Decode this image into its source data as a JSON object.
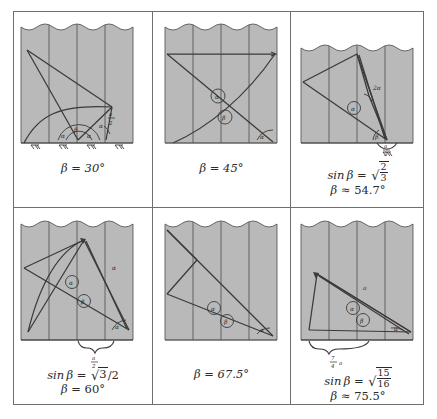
{
  "figure": {
    "kind": "geometry-diagram-grid",
    "rows": 2,
    "cols": 3,
    "background": "#ffffff",
    "border_color": "#6f6f6f",
    "shade_color": "#b9b9b9",
    "ink_color": "#3a3a3a",
    "label_alpha": "α",
    "label_beta": "β",
    "label_two_alpha": "2α"
  },
  "panels": [
    {
      "id": "panel-1",
      "caption_lines": [
        "β = 30°"
      ],
      "caption_html": "single",
      "beta_deg": 30,
      "angle_labels": [
        "α",
        "β"
      ],
      "measure_label": {
        "num": "a",
        "den": "2"
      },
      "has_curve": true,
      "has_ground_hatch": true,
      "hatch_count": 4,
      "has_brace": false,
      "stripe_count": 4
    },
    {
      "id": "panel-2",
      "caption_lines": [
        "β = 45°"
      ],
      "caption_html": "single",
      "beta_deg": 45,
      "angle_labels": [
        "α",
        "β"
      ],
      "measure_label": null,
      "has_curve": true,
      "has_ground_hatch": false,
      "hatch_count": 0,
      "has_brace": false,
      "stripe_count": 4
    },
    {
      "id": "panel-3",
      "caption_lines": [
        "sin β = √(2/3)",
        "β ≈ 54.7°"
      ],
      "caption_html": "sqrt-frac",
      "sqrt_numerator": "2",
      "sqrt_denominator": "3",
      "beta_deg": 54.7,
      "beta_relation": "≈",
      "angle_labels": [
        "α",
        "β",
        "2α"
      ],
      "measure_label": {
        "num": "a",
        "den": "3"
      },
      "has_curve": false,
      "has_ground_hatch": true,
      "hatch_count": 1,
      "has_brace": false,
      "stripe_count": 4
    },
    {
      "id": "panel-4",
      "caption_lines": [
        "sin β = √3/2",
        "β = 60°"
      ],
      "caption_html": "sqrt-over",
      "sqrt_numerator": "3",
      "divided_by": "2",
      "beta_deg": 60,
      "beta_relation": "=",
      "angle_labels": [
        "α",
        "β",
        "α"
      ],
      "measure_label": {
        "num": "a",
        "den": "2"
      },
      "has_curve": true,
      "has_ground_hatch": false,
      "hatch_count": 0,
      "has_brace": true,
      "stripe_count": 4
    },
    {
      "id": "panel-5",
      "caption_lines": [
        "β = 67.5°"
      ],
      "caption_html": "single",
      "beta_deg": 67.5,
      "angle_labels": [
        "α",
        "β",
        "α"
      ],
      "measure_label": null,
      "has_curve": false,
      "has_ground_hatch": false,
      "hatch_count": 0,
      "has_brace": false,
      "stripe_count": 4
    },
    {
      "id": "panel-6",
      "caption_lines": [
        "sin β = √(15/16)",
        "β ≈ 75.5°"
      ],
      "caption_html": "sqrt-frac",
      "sqrt_numerator": "15",
      "sqrt_denominator": "16",
      "beta_deg": 75.5,
      "beta_relation": "≈",
      "angle_labels": [
        "α",
        "β",
        "a"
      ],
      "measure_label": {
        "num": "7",
        "den": "4",
        "suffix": "a"
      },
      "has_curve": false,
      "has_ground_hatch": false,
      "hatch_count": 0,
      "has_brace": true,
      "stripe_count": 4
    }
  ]
}
